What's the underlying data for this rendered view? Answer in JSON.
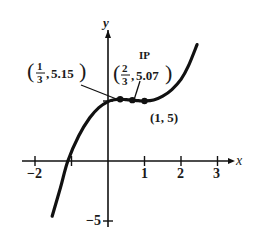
{
  "chart_data": {
    "type": "line",
    "title": "",
    "xlabel": "x",
    "ylabel": "y",
    "xlim": [
      -2.5,
      3.4
    ],
    "ylim": [
      -5.5,
      11
    ],
    "x_ticks": [
      -2,
      -1,
      1,
      2,
      3
    ],
    "x_tick_labels": [
      {
        "value": -2,
        "label": "−2"
      },
      {
        "value": 1,
        "label": "1"
      },
      {
        "value": 2,
        "label": "2"
      },
      {
        "value": 3,
        "label": "3"
      }
    ],
    "y_ticks": [
      5,
      -5
    ],
    "y_tick_labels": [
      {
        "value": -5,
        "label": "−5"
      }
    ],
    "grid": false,
    "series": [
      {
        "name": "f(x)",
        "x": [
          -1.53,
          -1.3,
          -1.1,
          -0.8,
          -0.5,
          -0.25,
          0,
          0.17,
          0.33,
          0.5,
          0.67,
          0.83,
          1,
          1.25,
          1.5,
          1.75,
          2,
          2.2,
          2.44
        ],
        "y": [
          -4.6,
          -2.2,
          0,
          2.1,
          3.6,
          4.45,
          4.95,
          5.1,
          5.15,
          5.11,
          5.07,
          5.03,
          5.0,
          5.08,
          5.4,
          5.95,
          6.8,
          7.9,
          9.7
        ]
      }
    ],
    "points": [
      {
        "x": 0.3333,
        "y": 5.15,
        "label_text": "5.15",
        "frac_num": "1",
        "frac_den": "3"
      },
      {
        "x": 0.6667,
        "y": 5.07,
        "label_text": "5.07",
        "frac_num": "2",
        "frac_den": "3"
      },
      {
        "x": 1,
        "y": 5,
        "label_text": "(1, 5)"
      }
    ],
    "annotations": [
      {
        "text": "IP",
        "target": "(2/3, 5.07)"
      }
    ]
  }
}
